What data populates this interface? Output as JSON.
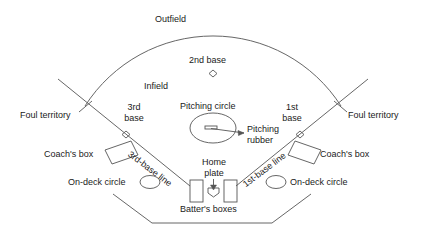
{
  "diagram": {
    "background_color": "#ffffff",
    "line_color": "#555555",
    "text_color": "#1a1a1a"
  },
  "labels": {
    "outfield": "Outfield",
    "infield": "Infield",
    "second_base": "2nd base",
    "third_base": "3rd\nbase",
    "third_base_line1": "3rd",
    "third_base_line2": "base",
    "first_base_line1": "1st",
    "first_base_line2": "base",
    "pitching_circle": "Pitching circle",
    "pitching_rubber_line1": "Pitching",
    "pitching_rubber_line2": "rubber",
    "foul_territory_left": "Foul territory",
    "foul_territory_right": "Foul territory",
    "third_base_line": "3rd-base line",
    "first_base_line": "1st-base line",
    "coachs_box_left": "Coach's box",
    "coachs_box_right": "Coach's box",
    "on_deck_circle_left": "On-deck circle",
    "on_deck_circle_right": "On-deck circle",
    "home_plate_line1": "Home",
    "home_plate_line2": "plate",
    "batters_boxes": "Batter's boxes"
  },
  "shapes": {
    "second_base_marker": "diamond",
    "third_base_marker": "diamond",
    "first_base_marker": "diamond",
    "pitching_circle_shape": "ellipse",
    "pitching_rubber_shape": "small-rectangle",
    "on_deck_circle_shape": "ellipse",
    "coachs_box_shape": "rotated-rectangle",
    "batters_box_shape": "rectangle",
    "home_plate_shape": "home-plate-pentagon",
    "backstop_shape": "polyline",
    "outfield_arc_shape": "arc",
    "foul_line_shape": "line"
  }
}
